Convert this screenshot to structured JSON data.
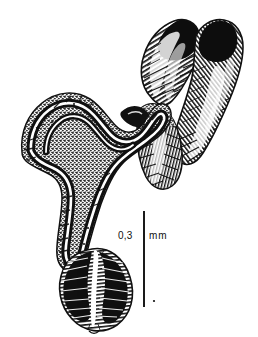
{
  "figure": {
    "kind": "scientific-line-drawing",
    "background_color": "#ffffff",
    "ink_color": "#111111"
  },
  "scalebar": {
    "value": "0,3",
    "unit": "mm",
    "line_color": "#1a1a1a",
    "line_top_y": 211,
    "line_bottom_y": 307,
    "line_x": 144
  },
  "parts": [
    {
      "id": "upper-left-lobe",
      "label": "upper left lobe"
    },
    {
      "id": "upper-right-lobe",
      "label": "upper right lobe"
    },
    {
      "id": "mid-junction",
      "label": "mid junction"
    },
    {
      "id": "coiled-duct",
      "label": "coiled duct"
    },
    {
      "id": "lower-bulb",
      "label": "lower bulb"
    }
  ]
}
